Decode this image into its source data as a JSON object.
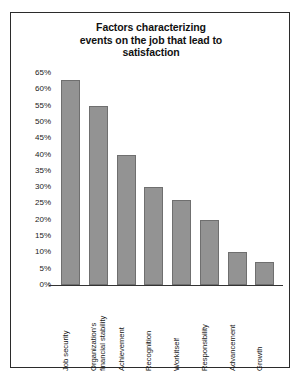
{
  "chart_data": {
    "type": "bar",
    "title": "Factors characterizing events on the job that lead to satisfaction",
    "title_lines": [
      "Factors characterizing",
      "events on the job that lead to",
      "satisfaction"
    ],
    "categories": [
      "Job security",
      "Organization's financial stability",
      "Achievement",
      "Recognition",
      "Workitself",
      "Responsibility",
      "Advancement",
      "Growth"
    ],
    "category_lines": [
      [
        "Job security"
      ],
      [
        "Organization's",
        "financial stability"
      ],
      [
        "Achievement"
      ],
      [
        "Recognition"
      ],
      [
        "Workitself"
      ],
      [
        "Responsibility"
      ],
      [
        "Advancement"
      ],
      [
        "Growth"
      ]
    ],
    "values": [
      63,
      55,
      40,
      30,
      26,
      20,
      10,
      7
    ],
    "xlabel": "",
    "ylabel": "",
    "ylim": [
      0,
      65
    ],
    "ytick_labels": [
      "65%",
      "60%",
      "55%",
      "50%",
      "45%",
      "40%",
      "35%",
      "30%",
      "25%",
      "20%",
      "15%",
      "10%",
      "5%",
      "0%"
    ],
    "ytick_values": [
      65,
      60,
      55,
      50,
      45,
      40,
      35,
      30,
      25,
      20,
      15,
      10,
      5,
      0
    ],
    "grid": false,
    "legend": false,
    "bar_color": "#939393",
    "bar_border_color": "#6f6f6f",
    "frame_color": "#2b2b2b",
    "background": "#ffffff"
  }
}
